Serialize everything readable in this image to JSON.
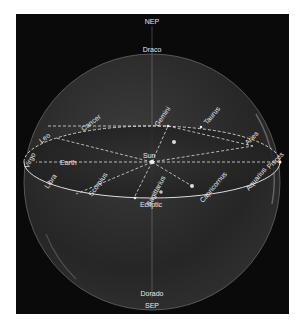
{
  "diagram": {
    "poles": {
      "north": {
        "label": "NEP",
        "constellation": "Draco"
      },
      "south": {
        "label": "SEP",
        "constellation": "Dorado"
      }
    },
    "plane_label": "Ecliptic",
    "bodies": {
      "sun": "Sun",
      "earth": "Earth"
    },
    "zodiac": [
      {
        "name": "Virgo"
      },
      {
        "name": "Leo"
      },
      {
        "name": "Cancer"
      },
      {
        "name": "Gemini"
      },
      {
        "name": "Taurus"
      },
      {
        "name": "Aries"
      },
      {
        "name": "Pisces"
      },
      {
        "name": "Aquarius"
      },
      {
        "name": "Capricornus"
      },
      {
        "name": "Sagittarius"
      },
      {
        "name": "Scorpius"
      },
      {
        "name": "Libra"
      }
    ],
    "colors": {
      "background": "#0a0a0a",
      "sphere": "#3a3a3a",
      "lines": "#d8d8d8",
      "text": "#e8e8e8"
    }
  }
}
